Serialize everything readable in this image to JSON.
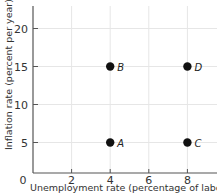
{
  "chart_data": {
    "type": "scatter",
    "title": "",
    "xlabel": "Unemployment rate (percentage of labor force)",
    "ylabel": "Inflation rate (percent per year)",
    "xlim": [
      0,
      9.5
    ],
    "ylim": [
      0,
      23
    ],
    "x_ticks": [
      "0",
      "2",
      "4",
      "6",
      "8"
    ],
    "y_ticks": [
      "5",
      "10",
      "15",
      "20"
    ],
    "grid": true,
    "points": [
      {
        "label": "A",
        "x": 4,
        "y": 5
      },
      {
        "label": "B",
        "x": 4,
        "y": 15
      },
      {
        "label": "C",
        "x": 8,
        "y": 5
      },
      {
        "label": "D",
        "x": 8,
        "y": 15
      }
    ]
  },
  "colors": {
    "axis": "#555555",
    "grid": "#e6e6e6",
    "point": "#111111"
  }
}
